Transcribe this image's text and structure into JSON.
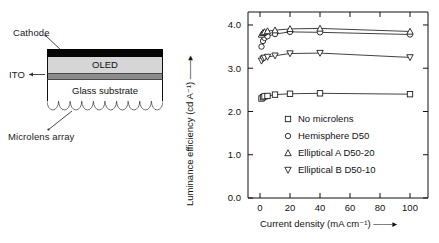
{
  "schematic": {
    "labels": {
      "cathode": "Cathode",
      "ito": "ITO",
      "microlens": "Microlens array"
    },
    "layers": {
      "oled": "OLED",
      "glass": "Glass substrate"
    },
    "microlens_count": 10,
    "colors": {
      "cathode": "#050505",
      "oled": "#d6d6d6",
      "ito": "#8a8a8a",
      "glass": "#ffffff",
      "outline": "#111111"
    }
  },
  "chart_data": {
    "type": "line",
    "title": "",
    "xlabel": "Current density (mA cm⁻¹)",
    "ylabel": "Luminance efficiency (cd A⁻¹)",
    "xlim": [
      -8,
      112
    ],
    "ylim": [
      0.0,
      4.3
    ],
    "xticks": [
      0,
      20,
      40,
      60,
      80,
      100
    ],
    "xticklabels": [
      "0",
      "20",
      "40",
      "60",
      "80",
      "100"
    ],
    "yticks": [
      0.0,
      1.0,
      2.0,
      3.0,
      4.0
    ],
    "yticklabels": [
      "0.0",
      "1.0",
      "2.0",
      "3.0",
      "4.0"
    ],
    "grid": false,
    "legend_position": "center-left",
    "x": [
      1,
      2,
      3,
      5,
      10,
      20,
      40,
      100
    ],
    "series": [
      {
        "name": "No microlens",
        "marker": "square",
        "values": [
          2.3,
          2.33,
          2.35,
          2.36,
          2.39,
          2.41,
          2.42,
          2.4
        ]
      },
      {
        "name": "Hemisphere  D50",
        "marker": "circle",
        "values": [
          3.5,
          3.63,
          3.7,
          3.74,
          3.79,
          3.84,
          3.83,
          3.78
        ]
      },
      {
        "name": "Elliptical A  D50-20",
        "marker": "triangle-up",
        "values": [
          3.78,
          3.82,
          3.84,
          3.86,
          3.88,
          3.91,
          3.92,
          3.85
        ]
      },
      {
        "name": "Elliptical B  D50-10",
        "marker": "triangle-down",
        "values": [
          3.17,
          3.22,
          3.24,
          3.26,
          3.29,
          3.34,
          3.35,
          3.25
        ]
      }
    ],
    "legend": [
      {
        "label": "No microlens",
        "marker": "square"
      },
      {
        "label": "Hemisphere  D50",
        "marker": "circle"
      },
      {
        "label": "Elliptical A  D50-20",
        "marker": "triangle-up"
      },
      {
        "label": "Elliptical B  D50-10",
        "marker": "triangle-down"
      }
    ]
  }
}
